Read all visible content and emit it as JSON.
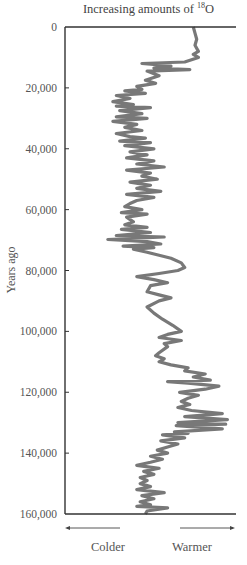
{
  "chart_data": {
    "type": "line",
    "orientation": "vertical",
    "title": "Increasing amounts of 18O",
    "title_parts": {
      "prefix": "Increasing amounts of ",
      "superscript": "18",
      "suffix": "O"
    },
    "xlabel_left": "Colder",
    "xlabel_right": "Warmer",
    "ylabel": "Years ago",
    "ylim": [
      0,
      160000
    ],
    "y_inverted": true,
    "y_ticks": [
      0,
      20000,
      40000,
      60000,
      80000,
      100000,
      120000,
      140000,
      160000
    ],
    "y_tick_labels": [
      "0",
      "20,000",
      "40,000",
      "60,000",
      "80,000",
      "100,000",
      "120,000",
      "140,000",
      "160,000"
    ],
    "x_units": "relative 18O index (0 = axis, 100 = right end)",
    "xlim": [
      0,
      100
    ],
    "grid": false,
    "line_color": "#787878",
    "series": [
      {
        "name": "18O record",
        "points": [
          [
            75,
            0
          ],
          [
            76,
            2000
          ],
          [
            77,
            4000
          ],
          [
            76,
            6000
          ],
          [
            78,
            8000
          ],
          [
            75,
            9000
          ],
          [
            78,
            10000
          ],
          [
            70,
            11500
          ],
          [
            45,
            12000
          ],
          [
            62,
            12800
          ],
          [
            52,
            13500
          ],
          [
            73,
            14000
          ],
          [
            48,
            14500
          ],
          [
            55,
            16000
          ],
          [
            47,
            17500
          ],
          [
            53,
            18500
          ],
          [
            42,
            19500
          ],
          [
            45,
            20500
          ],
          [
            35,
            21000
          ],
          [
            47,
            21800
          ],
          [
            30,
            22500
          ],
          [
            38,
            23500
          ],
          [
            28,
            24500
          ],
          [
            40,
            25500
          ],
          [
            30,
            26000
          ],
          [
            50,
            26500
          ],
          [
            32,
            27500
          ],
          [
            45,
            28500
          ],
          [
            30,
            29500
          ],
          [
            48,
            30000
          ],
          [
            28,
            31000
          ],
          [
            42,
            32000
          ],
          [
            35,
            33000
          ],
          [
            45,
            34000
          ],
          [
            30,
            35000
          ],
          [
            38,
            36000
          ],
          [
            47,
            36500
          ],
          [
            32,
            37500
          ],
          [
            50,
            38000
          ],
          [
            35,
            39000
          ],
          [
            52,
            40000
          ],
          [
            38,
            41000
          ],
          [
            48,
            42000
          ],
          [
            36,
            43000
          ],
          [
            52,
            44000
          ],
          [
            42,
            45000
          ],
          [
            58,
            46000
          ],
          [
            36,
            47000
          ],
          [
            50,
            48000
          ],
          [
            45,
            49000
          ],
          [
            54,
            50000
          ],
          [
            38,
            51000
          ],
          [
            50,
            52000
          ],
          [
            42,
            53000
          ],
          [
            56,
            54000
          ],
          [
            36,
            55000
          ],
          [
            52,
            56000
          ],
          [
            42,
            57000
          ],
          [
            38,
            58000
          ],
          [
            35,
            59000
          ],
          [
            45,
            60000
          ],
          [
            33,
            61000
          ],
          [
            48,
            61500
          ],
          [
            36,
            62500
          ],
          [
            40,
            64000
          ],
          [
            35,
            65000
          ],
          [
            48,
            65800
          ],
          [
            33,
            66500
          ],
          [
            50,
            67500
          ],
          [
            30,
            68500
          ],
          [
            58,
            69000
          ],
          [
            25,
            69800
          ],
          [
            48,
            70500
          ],
          [
            56,
            71300
          ],
          [
            34,
            72000
          ],
          [
            52,
            72500
          ],
          [
            40,
            73000
          ],
          [
            48,
            74000
          ],
          [
            55,
            75000
          ],
          [
            62,
            76000
          ],
          [
            68,
            77500
          ],
          [
            70,
            79000
          ],
          [
            66,
            80000
          ],
          [
            55,
            81000
          ],
          [
            42,
            82000
          ],
          [
            52,
            83000
          ],
          [
            60,
            84000
          ],
          [
            50,
            85000
          ],
          [
            48,
            87000
          ],
          [
            55,
            88000
          ],
          [
            62,
            89000
          ],
          [
            55,
            90000
          ],
          [
            48,
            92000
          ],
          [
            52,
            94000
          ],
          [
            57,
            96000
          ],
          [
            63,
            98000
          ],
          [
            68,
            100000
          ],
          [
            60,
            101000
          ],
          [
            55,
            102000
          ],
          [
            68,
            103000
          ],
          [
            58,
            104000
          ],
          [
            60,
            105000
          ],
          [
            55,
            107000
          ],
          [
            53,
            108000
          ],
          [
            58,
            109000
          ],
          [
            55,
            110000
          ],
          [
            62,
            111000
          ],
          [
            72,
            112000
          ],
          [
            70,
            113000
          ],
          [
            82,
            114000
          ],
          [
            75,
            115000
          ],
          [
            85,
            116000
          ],
          [
            60,
            116500
          ],
          [
            72,
            117000
          ],
          [
            90,
            118000
          ],
          [
            82,
            119000
          ],
          [
            67,
            120000
          ],
          [
            78,
            121000
          ],
          [
            72,
            122000
          ],
          [
            68,
            123000
          ],
          [
            73,
            124000
          ],
          [
            66,
            125000
          ],
          [
            74,
            126000
          ],
          [
            92,
            127000
          ],
          [
            70,
            128000
          ],
          [
            95,
            129000
          ],
          [
            66,
            130000
          ],
          [
            94,
            130500
          ],
          [
            65,
            131000
          ],
          [
            92,
            132000
          ],
          [
            64,
            133000
          ],
          [
            72,
            133500
          ],
          [
            57,
            134000
          ],
          [
            70,
            135000
          ],
          [
            56,
            136000
          ],
          [
            66,
            137000
          ],
          [
            60,
            138000
          ],
          [
            54,
            139000
          ],
          [
            60,
            140000
          ],
          [
            50,
            141000
          ],
          [
            57,
            142000
          ],
          [
            50,
            143000
          ],
          [
            42,
            144000
          ],
          [
            55,
            145000
          ],
          [
            46,
            146000
          ],
          [
            52,
            147000
          ],
          [
            44,
            148000
          ],
          [
            48,
            149000
          ],
          [
            44,
            150000
          ],
          [
            50,
            151000
          ],
          [
            42,
            152000
          ],
          [
            58,
            153000
          ],
          [
            45,
            154000
          ],
          [
            52,
            155000
          ],
          [
            44,
            156000
          ],
          [
            50,
            157000
          ],
          [
            42,
            157500
          ],
          [
            60,
            158000
          ],
          [
            48,
            159000
          ],
          [
            47,
            160000
          ]
        ]
      }
    ]
  }
}
